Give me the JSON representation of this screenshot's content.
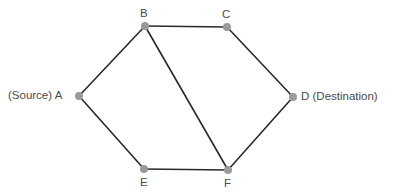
{
  "diagram": {
    "type": "graph",
    "directed": false,
    "colors": {
      "edge": "#2a2a2a",
      "node": "#9a9a9a",
      "label": "#4a4a4a",
      "background": "#ffffff"
    },
    "nodes": [
      {
        "id": "A",
        "label": "(Source) A",
        "x": 79,
        "y": 96,
        "label_pos": "left"
      },
      {
        "id": "B",
        "label": "B",
        "x": 145,
        "y": 26,
        "label_pos": "top"
      },
      {
        "id": "C",
        "label": "C",
        "x": 227,
        "y": 27,
        "label_pos": "top"
      },
      {
        "id": "D",
        "label": "D (Destination)",
        "x": 293,
        "y": 97,
        "label_pos": "right"
      },
      {
        "id": "E",
        "label": "E",
        "x": 144,
        "y": 169,
        "label_pos": "bottom"
      },
      {
        "id": "F",
        "label": "F",
        "x": 228,
        "y": 170,
        "label_pos": "bottom"
      }
    ],
    "edges": [
      {
        "from": "A",
        "to": "B"
      },
      {
        "from": "B",
        "to": "C"
      },
      {
        "from": "C",
        "to": "D"
      },
      {
        "from": "A",
        "to": "E"
      },
      {
        "from": "E",
        "to": "F"
      },
      {
        "from": "F",
        "to": "D"
      },
      {
        "from": "B",
        "to": "F"
      }
    ]
  }
}
